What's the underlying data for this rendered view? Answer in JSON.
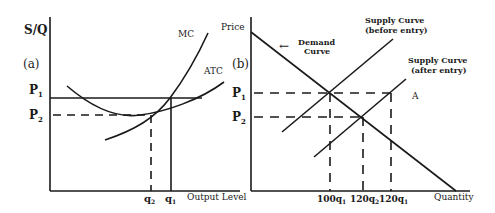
{
  "panel_a": {
    "tag": "(a)",
    "y_axis_label": "S/Q",
    "x_axis_label": "Output Level",
    "curves": {
      "mc": "MC",
      "atc": "ATC"
    },
    "price_labels": {
      "p1": "P",
      "p1_sub": "1",
      "p2": "P",
      "p2_sub": "2"
    },
    "quantity_labels": {
      "q2": "q",
      "q2_sub": "2",
      "q1": "q",
      "q1_sub": "1"
    }
  },
  "panel_b": {
    "tag": "(b)",
    "y_axis_label": "Price",
    "x_axis_label": "Quantity",
    "demand_label_line1": "Demand",
    "demand_label_line2": "Curve",
    "demand_arrow": "←",
    "supply_before_line1": "Supply Curve",
    "supply_before_line2": "(before entry)",
    "supply_after_line1": "Supply Curve",
    "supply_after_line2": "(after entry)",
    "point_a": "A",
    "price_labels": {
      "p1": "P",
      "p1_sub": "1",
      "p2": "P",
      "p2_sub": "2"
    },
    "quantity_labels": [
      {
        "main": "100q",
        "sub": "1"
      },
      {
        "main": "120q",
        "sub": "2"
      },
      {
        "main": "120q",
        "sub": "1"
      }
    ]
  },
  "colors": {
    "ink": "#1a1a1a",
    "background": "#ffffff"
  }
}
